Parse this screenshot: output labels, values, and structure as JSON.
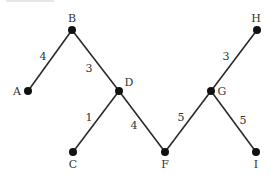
{
  "diagram": {
    "type": "weighted-tree",
    "nodes": [
      {
        "id": "A",
        "label": "A",
        "x": 28,
        "y": 91,
        "lx": 17,
        "ly": 95
      },
      {
        "id": "B",
        "label": "B",
        "x": 72,
        "y": 30,
        "lx": 72,
        "ly": 22
      },
      {
        "id": "C",
        "label": "C",
        "x": 73,
        "y": 152,
        "lx": 73,
        "ly": 168
      },
      {
        "id": "D",
        "label": "D",
        "x": 119,
        "y": 91,
        "lx": 129,
        "ly": 86
      },
      {
        "id": "F",
        "label": "F",
        "x": 165,
        "y": 152,
        "lx": 165,
        "ly": 168
      },
      {
        "id": "G",
        "label": "G",
        "x": 211,
        "y": 91,
        "lx": 222,
        "ly": 95
      },
      {
        "id": "H",
        "label": "H",
        "x": 257,
        "y": 30,
        "lx": 256,
        "ly": 22
      },
      {
        "id": "I",
        "label": "I",
        "x": 256,
        "y": 152,
        "lx": 256,
        "ly": 168
      }
    ],
    "edges": [
      {
        "from": "A",
        "to": "B",
        "weight": "4",
        "wx": 43,
        "wy": 60
      },
      {
        "from": "B",
        "to": "D",
        "weight": "3",
        "wx": 89,
        "wy": 72
      },
      {
        "from": "D",
        "to": "C",
        "weight": "1",
        "wx": 89,
        "wy": 121
      },
      {
        "from": "D",
        "to": "F",
        "weight": "4",
        "wx": 134,
        "wy": 129
      },
      {
        "from": "F",
        "to": "G",
        "weight": "5",
        "wx": 181,
        "wy": 121
      },
      {
        "from": "G",
        "to": "H",
        "weight": "3",
        "wx": 226,
        "wy": 60
      },
      {
        "from": "G",
        "to": "I",
        "weight": "5",
        "wx": 243,
        "wy": 124
      }
    ]
  }
}
